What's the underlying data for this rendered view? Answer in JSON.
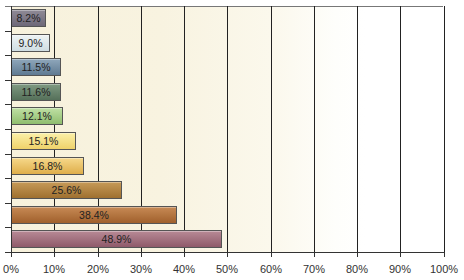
{
  "chart_data": {
    "type": "bar",
    "orientation": "horizontal",
    "title": "",
    "xlabel": "",
    "ylabel": "",
    "xlim": [
      0,
      100
    ],
    "grid": true,
    "legend": null,
    "categories": [
      "",
      "",
      "",
      "",
      "",
      "",
      "",
      "",
      "",
      ""
    ],
    "values": [
      8.2,
      9.0,
      11.5,
      11.6,
      12.1,
      15.1,
      16.8,
      25.6,
      38.4,
      48.9
    ],
    "data_labels": [
      "8.2%",
      "9.0%",
      "11.5%",
      "11.6%",
      "12.1%",
      "15.1%",
      "16.8%",
      "25.6%",
      "38.4%",
      "48.9%"
    ],
    "bar_colors": [
      [
        "#8f8a96",
        "#6e6878"
      ],
      [
        "#eef3f4",
        "#cfdde2"
      ],
      [
        "#8fa7bb",
        "#5f7a92"
      ],
      [
        "#7f9a82",
        "#55705a"
      ],
      [
        "#bfe0a4",
        "#8fbd6e"
      ],
      [
        "#fbf0a8",
        "#efd26a"
      ],
      [
        "#f6d88a",
        "#dfae4a"
      ],
      [
        "#c79a58",
        "#9f7030"
      ],
      [
        "#c78a55",
        "#a0602c"
      ],
      [
        "#b88a96",
        "#8f5a6a"
      ]
    ],
    "x_ticks": [
      "0%",
      "10%",
      "20%",
      "30%",
      "40%",
      "50%",
      "60%",
      "70%",
      "80%",
      "90%",
      "100%"
    ]
  }
}
